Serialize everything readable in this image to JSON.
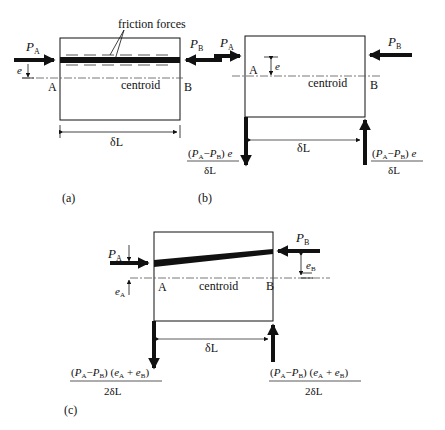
{
  "panel_a": {
    "caption": "(a)",
    "label_friction": "friction forces",
    "force_left": {
      "sym": "P",
      "sub": "A"
    },
    "force_right": {
      "sym": "P",
      "sub": "B"
    },
    "ecc": "e",
    "point_a": "A",
    "point_b": "B",
    "centroid": "centroid",
    "length": "δL"
  },
  "panel_b": {
    "caption": "(b)",
    "force_left": {
      "sym": "P",
      "sub": "A"
    },
    "force_right": {
      "sym": "P",
      "sub": "B"
    },
    "ecc": "e",
    "point_a": "A",
    "point_b": "B",
    "centroid": "centroid",
    "length": "δL",
    "reaction_num": "(P_A − P_B) e",
    "reaction_den": "δL"
  },
  "panel_c": {
    "caption": "(c)",
    "force_left": {
      "sym": "P",
      "sub": "A"
    },
    "force_right": {
      "sym": "P",
      "sub": "B"
    },
    "ecc_a": {
      "sym": "e",
      "sub": "A"
    },
    "ecc_b": {
      "sym": "e",
      "sub": "B"
    },
    "point_a": "A",
    "point_b": "B",
    "centroid": "centroid",
    "length": "δL",
    "reaction_num": "(P_A − P_B) (e_A + e_B)",
    "reaction_den": "2δL"
  },
  "colors": {
    "ink": "#111111",
    "background": "#ffffff"
  }
}
